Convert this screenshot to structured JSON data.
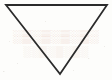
{
  "figure": {
    "shape_name": "triangle",
    "orientation": "point-down",
    "background_color": "#fdfdfb",
    "stroke_color": "#2b2b2b",
    "stroke_width": 1.8,
    "fill": "none",
    "canvas": {
      "width": 112,
      "height": 80
    },
    "vertices": [
      {
        "name": "top-left",
        "x": 6,
        "y": 5
      },
      {
        "name": "top-right",
        "x": 107,
        "y": 5
      },
      {
        "name": "bottom-apex",
        "x": 60,
        "y": 74
      }
    ]
  },
  "watermark": {
    "visible": true,
    "color_primary": "#e9c6b6",
    "color_secondary": "#ecd2c4",
    "line_one": "░▒░▒░▒░▒░",
    "line_two": "░░▒░▒░▒░"
  }
}
